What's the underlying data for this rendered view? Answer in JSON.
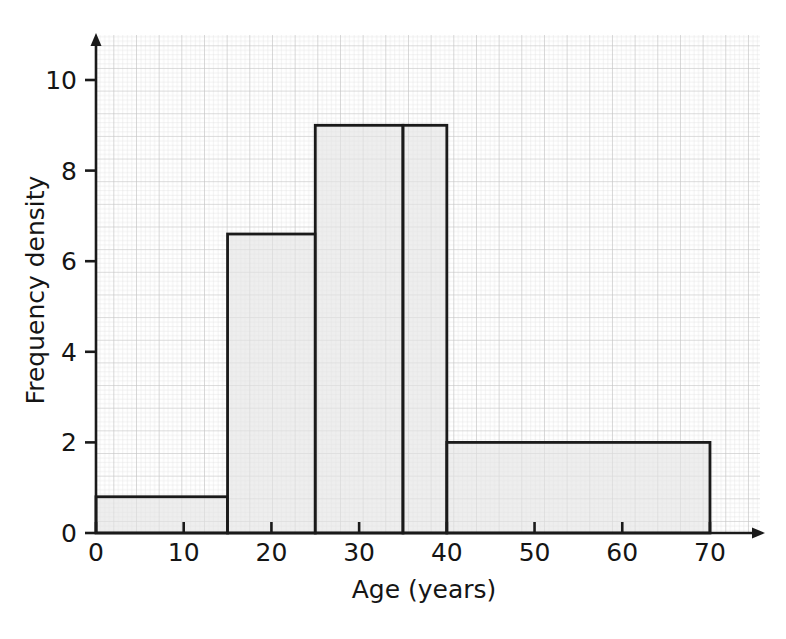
{
  "chart_data": {
    "type": "bar",
    "title": "",
    "subtitle": "",
    "xlabel": "Age (years)",
    "ylabel": "Frequency density",
    "xlim": [
      0,
      75
    ],
    "ylim": [
      0,
      11
    ],
    "xticks": [
      0,
      10,
      20,
      30,
      40,
      50,
      60,
      70
    ],
    "xtick_labels": [
      "0",
      "10",
      "20",
      "30",
      "40",
      "50",
      "60",
      "70"
    ],
    "yticks": [
      0,
      2,
      4,
      6,
      8,
      10
    ],
    "ytick_labels": [
      "0",
      "2",
      "4",
      "6",
      "8",
      "10"
    ],
    "grid": true,
    "grid_minor_step": 1,
    "grid_major_step": 5,
    "legend": null,
    "bars": [
      {
        "label": "0-15",
        "x_start": 0,
        "x_end": 15,
        "value": 0.8,
        "width": 15,
        "frequency": 12
      },
      {
        "label": "15-25",
        "x_start": 15,
        "x_end": 25,
        "value": 6.6,
        "width": 10,
        "frequency": 66
      },
      {
        "label": "25-35",
        "x_start": 25,
        "x_end": 35,
        "value": 9.0,
        "width": 10,
        "frequency": 90
      },
      {
        "label": "35-40",
        "x_start": 35,
        "x_end": 40,
        "value": 9.0,
        "width": 5,
        "frequency": 45
      },
      {
        "label": "40-70",
        "x_start": 40,
        "x_end": 70,
        "value": 2.0,
        "width": 30,
        "frequency": 60
      }
    ],
    "bar_fill_color": "#e3e3e3",
    "bar_edge_color": "#1a1a1a",
    "grid_minor_color": "#e0e0e0",
    "grid_major_color": "#c8c8c8",
    "axis_color": "#1a1a1a"
  },
  "axes": {
    "x_axis_label": "Age (years)",
    "y_axis_label": "Frequency density"
  }
}
